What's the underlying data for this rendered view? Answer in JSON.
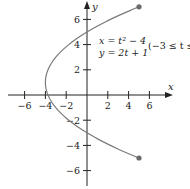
{
  "chart_data": {
    "type": "line",
    "title": "",
    "xlabel": "x",
    "ylabel": "y",
    "xlim": [
      -7,
      7.5
    ],
    "ylim": [
      -7,
      7.5
    ],
    "x_ticks": [
      -6,
      -4,
      -2,
      2,
      4,
      6
    ],
    "y_ticks": [
      6,
      4,
      2,
      -2,
      -4,
      -6
    ],
    "x_tick_labels": [
      "−6",
      "−4",
      "−2",
      "2",
      "4",
      "6"
    ],
    "y_tick_labels": [
      "6",
      "4",
      "2",
      "−2",
      "−4",
      "−6"
    ],
    "grid": false,
    "annotation": {
      "line1": "x = t² − 4",
      "line2": "y = 2t + 1",
      "domain": "(−3 ≤ t ≤ 3)"
    },
    "parametric": {
      "x": "t^2 - 4",
      "y": "2t + 1",
      "t_min": -3,
      "t_max": 3
    },
    "series": [
      {
        "name": "parametric curve",
        "points": [
          {
            "t": -3,
            "x": 5,
            "y": -5
          },
          {
            "t": -2,
            "x": 0,
            "y": -3
          },
          {
            "t": -1,
            "x": -3,
            "y": -1
          },
          {
            "t": 0,
            "x": -4,
            "y": 1
          },
          {
            "t": 1,
            "x": -3,
            "y": 3
          },
          {
            "t": 2,
            "x": 0,
            "y": 5
          },
          {
            "t": 3,
            "x": 5,
            "y": 7
          }
        ],
        "endpoints": [
          {
            "x": 5,
            "y": 7
          },
          {
            "x": 5,
            "y": -5
          }
        ]
      }
    ],
    "colors": {
      "curve": "#7a7a7a",
      "axis": "#222222",
      "endpoint": "#6a6a6a"
    }
  }
}
